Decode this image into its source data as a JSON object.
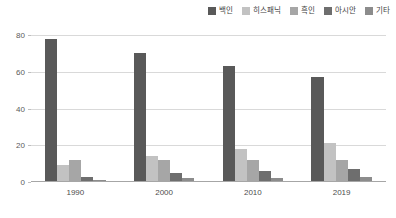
{
  "chart_data": {
    "type": "bar",
    "title": "",
    "xlabel": "",
    "ylabel": "",
    "ylim": [
      0,
      80
    ],
    "yticks": [
      0,
      20,
      40,
      60,
      80
    ],
    "grid": true,
    "legend_position": "top-right",
    "categories": [
      "1990",
      "2000",
      "2010",
      "2019"
    ],
    "series": [
      {
        "name": "백인",
        "color": "#595959",
        "values": [
          78,
          70,
          63,
          57
        ]
      },
      {
        "name": "히스패닉",
        "color": "#c2c2c2",
        "values": [
          9,
          14,
          18,
          21
        ]
      },
      {
        "name": "흑인",
        "color": "#a6a6a6",
        "values": [
          12,
          12,
          12,
          12
        ]
      },
      {
        "name": "아시안",
        "color": "#6e6e6e",
        "values": [
          3,
          5,
          6,
          7
        ]
      },
      {
        "name": "기타",
        "color": "#8c8c8c",
        "values": [
          1,
          2,
          2,
          3
        ]
      }
    ]
  }
}
